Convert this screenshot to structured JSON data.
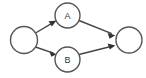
{
  "figure": {
    "background_color": "#ffffff"
  },
  "style": {
    "node_fill": "#ffffff",
    "node_stroke": "#555555",
    "node_stroke_width": 1.4,
    "edge_color": "#444444",
    "edge_width": 1.4,
    "arrow_fill": "#333333",
    "label_color": "#333333",
    "label_font_size": 9
  },
  "diagram": {
    "type": "directed-graph",
    "layout": "left-to-right",
    "node_count": 4,
    "edge_count": 4,
    "nodes": [
      {
        "id": "start",
        "label": "",
        "cx": 24,
        "cy": 40,
        "r": 13.5
      },
      {
        "id": "a",
        "label": "A",
        "cx": 67.5,
        "cy": 15.5,
        "r": 12.5
      },
      {
        "id": "b",
        "label": "B",
        "cx": 67.5,
        "cy": 59.5,
        "r": 12.5
      },
      {
        "id": "end",
        "label": "",
        "cx": 129,
        "cy": 40,
        "r": 13
      }
    ],
    "edges": [
      {
        "id": "start-a",
        "from": "start",
        "to": "a",
        "x1": 35.5,
        "y1": 33.0,
        "x2": 56.0,
        "y2": 21.0,
        "arrow": true
      },
      {
        "id": "start-b",
        "from": "start",
        "to": "b",
        "x1": 35.5,
        "y1": 47.0,
        "x2": 56.0,
        "y2": 54.0,
        "arrow": true
      },
      {
        "id": "a-end",
        "from": "a",
        "to": "end",
        "x1": 79.0,
        "y1": 20.5,
        "x2": 115.0,
        "y2": 35.0,
        "arrow": true
      },
      {
        "id": "b-end",
        "from": "b",
        "to": "end",
        "x1": 79.0,
        "y1": 54.5,
        "x2": 115.0,
        "y2": 45.0,
        "arrow": true
      }
    ]
  }
}
